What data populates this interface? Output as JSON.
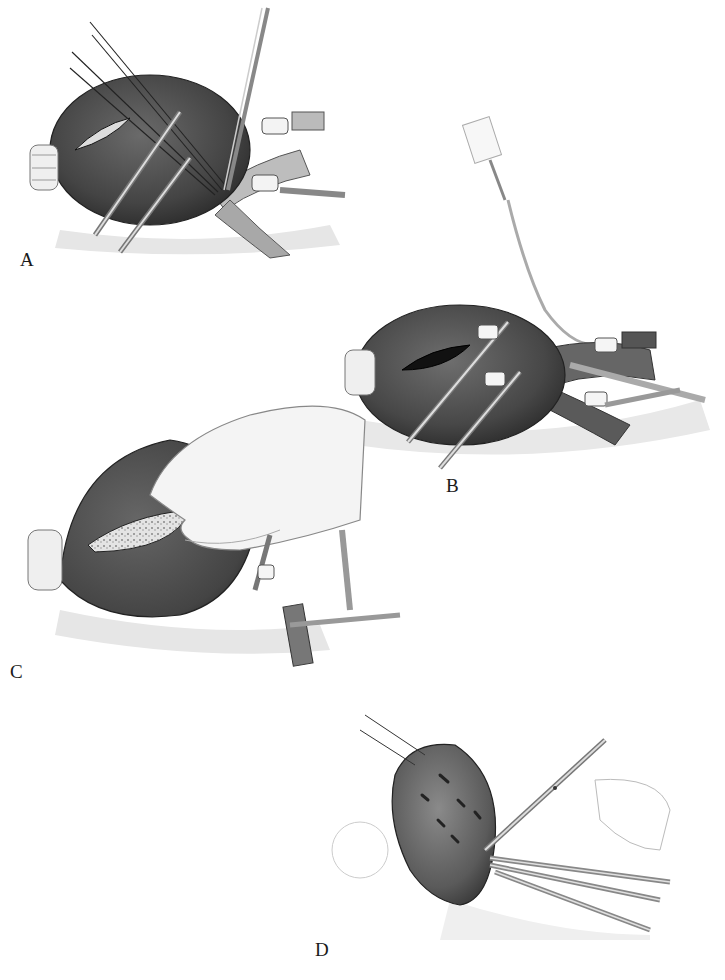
{
  "figure": {
    "panels": [
      {
        "id": "A",
        "label": "A",
        "description": "Organ with incision held by multiple stay sutures and clamps; vessel clamps at hilum"
      },
      {
        "id": "B",
        "label": "B",
        "description": "Opened incision with clamps; syringe and catheter inserted into vessel near hilum"
      },
      {
        "id": "C",
        "label": "C",
        "description": "Hand compressing organ with exposed parenchyma along incision; vessel clamps"
      },
      {
        "id": "D",
        "label": "D",
        "description": "Organ retracted by sutures; scissors and clamps dividing hilar vessels"
      }
    ]
  },
  "colors": {
    "organ": "#4a4a4a",
    "organ_dark": "#2e2e2e",
    "organ_light": "#7a7a7a",
    "tissue": "#cfcfcf",
    "instrument": "#9a9a9a",
    "line": "#222222",
    "background": "#ffffff"
  }
}
